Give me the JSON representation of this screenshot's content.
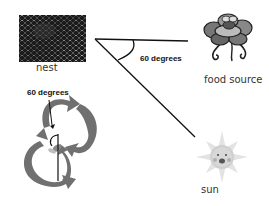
{
  "diagram": {
    "nodes": [
      {
        "id": "nest",
        "label": "nest",
        "icon": "honeycomb-image"
      },
      {
        "id": "food",
        "label": "food source",
        "icon": "flower-with-bee-image"
      },
      {
        "id": "sun",
        "label": "sun",
        "icon": "smiling-sun-image"
      }
    ],
    "angles": {
      "field_angle_label": "60 degrees",
      "dance_angle_label": "60 degrees"
    },
    "lines": [
      {
        "from": "nest",
        "to": "food",
        "desc": "line from nest to food source"
      },
      {
        "from": "nest",
        "to": "sun",
        "desc": "line from nest toward sun"
      },
      {
        "desc": "vertical reference line through waggle dance"
      }
    ],
    "dance": {
      "shape": "figure-eight waggle dance arrows",
      "colors": {
        "arrow": "#6e6e6e",
        "line": "#111111"
      }
    }
  }
}
